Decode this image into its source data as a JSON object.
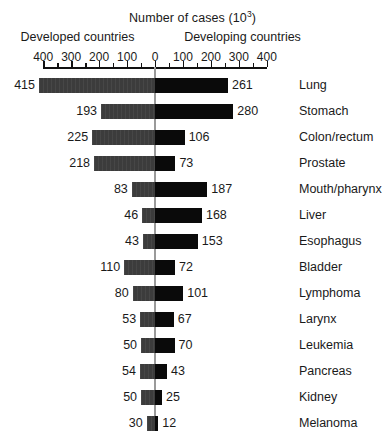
{
  "chart_data": {
    "type": "bar",
    "subtype": "diverging-horizontal-bar",
    "title_base": "Number of cases (10",
    "title_sup": "3",
    "title_close": ")",
    "xlabel": "Number of cases (10³)",
    "ylabel": "",
    "grid": false,
    "legend_position": "top",
    "axis": {
      "tick_labels_left": [
        "400",
        "300",
        "200",
        "100"
      ],
      "tick_labels_center": "0",
      "tick_labels_right": [
        "100",
        "200",
        "300",
        "400"
      ],
      "tick_values": [
        -400,
        -300,
        -200,
        -100,
        0,
        100,
        200,
        300,
        400
      ],
      "minor_tick_interval": 50,
      "major_tick_interval": 100,
      "xlim": [
        -400,
        400
      ],
      "unit": "10^3 cases"
    },
    "series": [
      {
        "name": "Developed countries",
        "side": "left",
        "color": "#3c3c3c",
        "values": [
          415,
          193,
          225,
          218,
          83,
          46,
          43,
          110,
          80,
          53,
          50,
          54,
          50,
          30
        ]
      },
      {
        "name": "Developing countries",
        "side": "right",
        "color": "#0a0a0a",
        "values": [
          261,
          280,
          106,
          73,
          187,
          168,
          153,
          72,
          101,
          67,
          70,
          43,
          25,
          12
        ]
      }
    ],
    "categories": [
      "Lung",
      "Stomach",
      "Colon/rectum",
      "Prostate",
      "Mouth/pharynx",
      "Liver",
      "Esophagus",
      "Bladder",
      "Lymphoma",
      "Larynx",
      "Leukemia",
      "Pancreas",
      "Kidney",
      "Melanoma"
    ],
    "rows": [
      {
        "category": "Lung",
        "left": 415,
        "right": 261
      },
      {
        "category": "Stomach",
        "left": 193,
        "right": 280
      },
      {
        "category": "Colon/rectum",
        "left": 225,
        "right": 106
      },
      {
        "category": "Prostate",
        "left": 218,
        "right": 73
      },
      {
        "category": "Mouth/pharynx",
        "left": 83,
        "right": 187
      },
      {
        "category": "Liver",
        "left": 46,
        "right": 168
      },
      {
        "category": "Esophagus",
        "left": 43,
        "right": 153
      },
      {
        "category": "Bladder",
        "left": 110,
        "right": 72
      },
      {
        "category": "Lymphoma",
        "left": 80,
        "right": 101
      },
      {
        "category": "Larynx",
        "left": 53,
        "right": 67
      },
      {
        "category": "Leukemia",
        "left": 50,
        "right": 70
      },
      {
        "category": "Pancreas",
        "left": 54,
        "right": 43
      },
      {
        "category": "Kidney",
        "left": 50,
        "right": 25
      },
      {
        "category": "Melanoma",
        "left": 30,
        "right": 12
      }
    ]
  },
  "header": {
    "left_group_label": "Developed countries",
    "right_group_label": "Developing countries"
  },
  "colors": {
    "left_bar": "#3c3c3c",
    "right_bar": "#0a0a0a",
    "axis": "#111111",
    "zero_line": "#9a9a9a",
    "text": "#1a1a1a",
    "background": "#ffffff"
  }
}
